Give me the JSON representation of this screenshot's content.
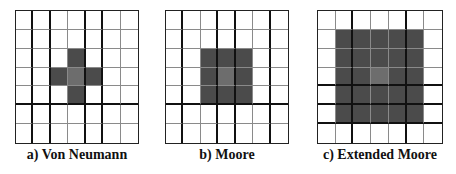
{
  "figure": {
    "colors": {
      "background": "#ffffff",
      "grid_line": "#8a8a8a",
      "thick_line": "#111111",
      "neighbor_fill": "#4b4b4b",
      "center_fill": "#6d6d6d"
    },
    "panels": [
      {
        "id": "a",
        "caption": "a) Von Neumann",
        "left": 15,
        "width": 124,
        "height": 134,
        "rows": 7,
        "cols": 7,
        "cells": [
          [
            0,
            0,
            0,
            0,
            0,
            0,
            0
          ],
          [
            0,
            0,
            0,
            0,
            0,
            0,
            0
          ],
          [
            0,
            0,
            0,
            1,
            0,
            0,
            0
          ],
          [
            0,
            0,
            1,
            2,
            1,
            0,
            0
          ],
          [
            0,
            0,
            0,
            1,
            0,
            0,
            0
          ],
          [
            0,
            0,
            0,
            0,
            0,
            0,
            0
          ],
          [
            0,
            0,
            0,
            0,
            0,
            0,
            0
          ]
        ],
        "thick_vertical_after_cols": [
          0,
          1,
          3,
          4
        ],
        "thick_horizontal_after_rows": [
          4
        ]
      },
      {
        "id": "b",
        "caption": "b) Moore",
        "left": 165,
        "width": 124,
        "height": 134,
        "rows": 7,
        "cols": 7,
        "cells": [
          [
            0,
            0,
            0,
            0,
            0,
            0,
            0
          ],
          [
            0,
            0,
            0,
            0,
            0,
            0,
            0
          ],
          [
            0,
            0,
            1,
            1,
            1,
            0,
            0
          ],
          [
            0,
            0,
            1,
            2,
            1,
            0,
            0
          ],
          [
            0,
            0,
            1,
            1,
            1,
            0,
            0
          ],
          [
            0,
            0,
            0,
            0,
            0,
            0,
            0
          ],
          [
            0,
            0,
            0,
            0,
            0,
            0,
            0
          ]
        ],
        "thick_vertical_after_cols": [
          0,
          2,
          3,
          5
        ],
        "thick_horizontal_after_rows": [
          4
        ]
      },
      {
        "id": "c",
        "caption": "c) Extended Moore",
        "left": 317,
        "width": 126,
        "height": 134,
        "rows": 7,
        "cols": 7,
        "cells": [
          [
            0,
            0,
            0,
            0,
            0,
            0,
            0
          ],
          [
            0,
            1,
            1,
            1,
            1,
            1,
            0
          ],
          [
            0,
            1,
            1,
            1,
            1,
            1,
            0
          ],
          [
            0,
            1,
            1,
            2,
            1,
            1,
            0
          ],
          [
            0,
            1,
            1,
            1,
            1,
            1,
            0
          ],
          [
            0,
            1,
            1,
            1,
            1,
            1,
            0
          ],
          [
            0,
            0,
            0,
            0,
            0,
            0,
            0
          ]
        ],
        "thick_vertical_after_cols": [
          1,
          4
        ],
        "thick_horizontal_after_rows": [
          3,
          4,
          5
        ]
      }
    ]
  }
}
